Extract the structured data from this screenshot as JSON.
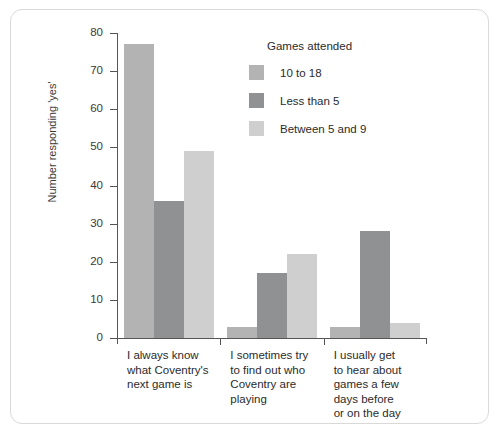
{
  "chart_data": {
    "type": "bar",
    "title": "",
    "xlabel": "",
    "ylabel": "Number responding 'yes'",
    "ylim": [
      0,
      80
    ],
    "yticks": [
      0,
      10,
      20,
      30,
      40,
      50,
      60,
      70,
      80
    ],
    "grid": false,
    "legend_position": "upper-center-right",
    "legend_title": "Games attended",
    "categories": [
      "I always know what Coventry's next game is",
      "I sometimes try to find out who Coventry are playing",
      "I usually get to hear about games a few days before or on the day"
    ],
    "category_lines": [
      [
        "I always know",
        "what Coventry's",
        "next game is"
      ],
      [
        "I sometimes try",
        "to find out who",
        "Coventry are",
        "playing"
      ],
      [
        "I usually get",
        "to hear about",
        "games a few",
        "days before",
        "or on the day"
      ]
    ],
    "series": [
      {
        "name": "10 to 18",
        "color": "#b3b3b3",
        "values": [
          77,
          3,
          3
        ]
      },
      {
        "name": "Less than 5",
        "color": "#8f9193",
        "values": [
          36,
          17,
          28
        ]
      },
      {
        "name": "Between 5 and 9",
        "color": "#cfcfcf",
        "values": [
          49,
          22,
          4
        ]
      }
    ]
  },
  "colors": {
    "frame": "#d9d9d9",
    "axis": "#555555",
    "text": "#2b2b2b",
    "background": "#ffffff"
  }
}
